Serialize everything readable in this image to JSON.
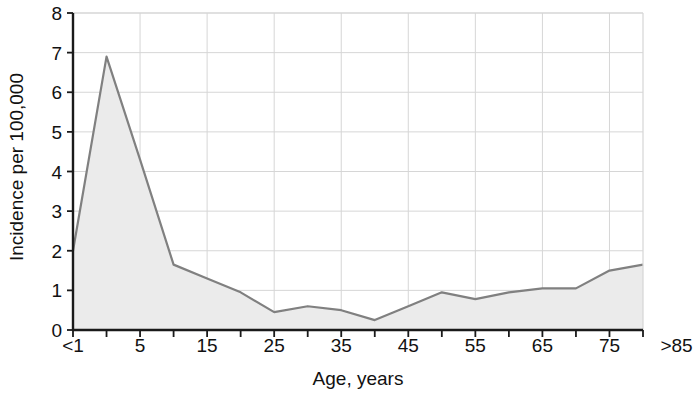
{
  "chart_data": {
    "type": "area",
    "title": "",
    "xlabel": "Age, years",
    "ylabel": "Incidence per 100,000",
    "categories": [
      "<1",
      "5",
      "10",
      "15",
      "20",
      "25",
      "30",
      "35",
      "40",
      "45",
      "50",
      "55",
      "60",
      "65",
      "70",
      "75",
      "80",
      ">85"
    ],
    "x_tick_labels": [
      "<1",
      "5",
      "15",
      "25",
      "35",
      "45",
      "55",
      "65",
      "75",
      ">85"
    ],
    "y_tick_labels": [
      "0",
      "1",
      "2",
      "3",
      "4",
      "5",
      "6",
      "7",
      "8"
    ],
    "values": [
      2.0,
      6.9,
      4.3,
      1.65,
      1.3,
      0.95,
      0.45,
      0.6,
      0.5,
      0.25,
      0.6,
      0.95,
      0.78,
      0.95,
      1.05,
      1.05,
      1.5,
      1.65
    ],
    "ylim": [
      0,
      8
    ],
    "y_major_step": 1,
    "x_minor_ticks": 18,
    "grid": true,
    "legend": "none",
    "series": [
      {
        "name": "Incidence per 100,000",
        "values": [
          2.0,
          6.9,
          4.3,
          1.65,
          1.3,
          0.95,
          0.45,
          0.6,
          0.5,
          0.25,
          0.6,
          0.95,
          0.78,
          0.95,
          1.05,
          1.05,
          1.5,
          1.65
        ]
      }
    ],
    "colors": {
      "line": "#808080",
      "fill": "#ebebeb",
      "axis": "#1a1a1a",
      "grid": "#d6d6d6"
    }
  }
}
